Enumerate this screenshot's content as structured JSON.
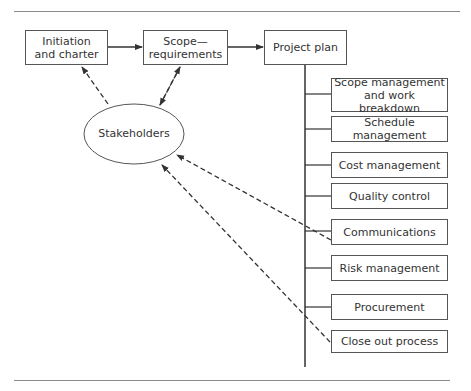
{
  "diagram": {
    "nodes": {
      "initiation": "Initiation\nand charter",
      "scope": "Scope—\nrequirements",
      "plan": "Project plan",
      "stakeholders": "Stakeholders"
    },
    "plan_items": [
      "Scope management\nand work breakdown",
      "Schedule management",
      "Cost management",
      "Quality control",
      "Communications",
      "Risk management",
      "Procurement",
      "Close out process"
    ],
    "colors": {
      "line": "#333333",
      "border": "#555555",
      "rule": "#8a8a8a"
    }
  }
}
